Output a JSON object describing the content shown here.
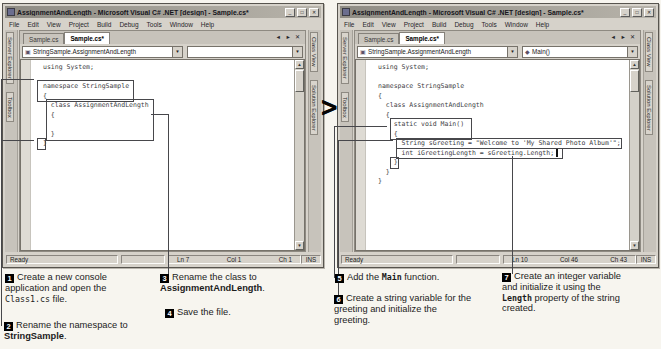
{
  "arrow_glyph": ">",
  "icons": {
    "minimize": "_",
    "maximize": "□",
    "close": "✕",
    "dropdown": "▼",
    "scroll_up": "▲",
    "scroll_down": "▼",
    "tab_controls": "◄ ► ✕",
    "class_icon": "▣",
    "method_icon": "◆"
  },
  "colors": {
    "chrome": "#d6d2ca",
    "titlebar": "#8f8c84",
    "paper": "#f7f5ef",
    "callout_border": "#47474b",
    "step_marker": "#000000"
  },
  "windows": {
    "left": {
      "title": "AssignmentAndLength - Microsoft Visual C# .NET [design] - Sample.cs*",
      "menu": [
        "File",
        "Edit",
        "View",
        "Project",
        "Build",
        "Debug",
        "Tools",
        "Window",
        "Help"
      ],
      "tabs": [
        {
          "label": "Sample.cs"
        },
        {
          "label": "Sample.cs*"
        }
      ],
      "combo_type": "StringSample.AssignmentAndLength",
      "combo_member": "",
      "left_tabs": [
        "Server Explorer",
        "Toolbox"
      ],
      "right_tabs": [
        "Class View",
        "Solution Explorer"
      ],
      "code_lines": [
        "using System;",
        "",
        "namespace StringSample",
        "{",
        "  class AssignmentAndLength",
        "  {",
        "",
        "  }",
        "}"
      ],
      "status": {
        "ready": "Ready",
        "ln": "Ln 7",
        "col": "Col 1",
        "ch": "Ch 1",
        "ins": "INS"
      }
    },
    "right": {
      "title": "AssignmentAndLength - Microsoft Visual C# .NET [design] - Sample.cs*",
      "menu": [
        "File",
        "Edit",
        "View",
        "Project",
        "Build",
        "Debug",
        "Tools",
        "Window",
        "Help"
      ],
      "tabs": [
        {
          "label": "Sample.cs"
        },
        {
          "label": "Sample.cs*"
        }
      ],
      "combo_type": "StringSample.AssignmentAndLength",
      "combo_member": "Main()",
      "left_tabs": [
        "Server Explorer",
        "Toolbox"
      ],
      "right_tabs": [
        "Class View",
        "Solution Explorer"
      ],
      "code_lines": [
        "using System;",
        "",
        "namespace StringSample",
        "{",
        "  class AssignmentAndLength",
        "  {",
        "    static void Main()",
        "    {",
        "      String sGreeting = \"Welcome to 'My Shared Photo Album'\";",
        "      int iGreetingLength = sGreeting.Length;",
        "    }",
        "  }",
        "}"
      ],
      "status": {
        "ready": "Ready",
        "ln": "Ln 10",
        "col": "Col 46",
        "ch": "Ch 43",
        "ins": "INS"
      }
    }
  },
  "steps": [
    {
      "num": "1",
      "runs": [
        {
          "t": "Create a new console application and open the "
        },
        {
          "t": "Class1.cs",
          "style": "code"
        },
        {
          "t": " file."
        }
      ]
    },
    {
      "num": "2",
      "runs": [
        {
          "t": "Rename the namespace to "
        },
        {
          "t": "StringSample",
          "style": "bold"
        },
        {
          "t": "."
        }
      ]
    },
    {
      "num": "3",
      "runs": [
        {
          "t": "Rename the class to "
        },
        {
          "t": "AssignmentAndLength",
          "style": "bold"
        },
        {
          "t": "."
        }
      ]
    },
    {
      "num": "4",
      "runs": [
        {
          "t": "Save the file."
        }
      ]
    },
    {
      "num": "5",
      "runs": [
        {
          "t": "Add the "
        },
        {
          "t": "Main",
          "style": "codebold"
        },
        {
          "t": " function."
        }
      ]
    },
    {
      "num": "6",
      "runs": [
        {
          "t": "Create a string variable for the greeting and initialize the greeting."
        }
      ]
    },
    {
      "num": "7",
      "runs": [
        {
          "t": "Create an integer variable and initialize it using the "
        },
        {
          "t": "Length",
          "style": "codebold"
        },
        {
          "t": " property of the string created."
        }
      ]
    }
  ]
}
